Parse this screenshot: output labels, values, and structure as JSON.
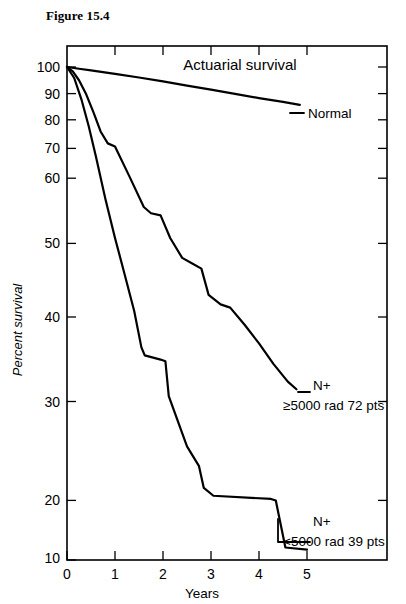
{
  "figure": {
    "caption": "Figure 15.4",
    "plot_title": "Actuarial survival"
  },
  "axes": {
    "y_label": "Percent survival",
    "x_label": "Years",
    "y_ticks": [
      "100",
      "90",
      "80",
      "70",
      "60",
      "50",
      "40",
      "30",
      "20",
      "10"
    ],
    "x_ticks": [
      "0",
      "1",
      "2",
      "3",
      "4",
      "5"
    ]
  },
  "annotations": {
    "normal": "Normal",
    "high_dose_line1": "N+",
    "high_dose_line2": "≥5000 rad   72 pts",
    "low_dose_line1": "N+",
    "low_dose_line2": "<5000 rad   39 pts"
  },
  "chart_data": {
    "type": "line",
    "title": "Actuarial survival",
    "xlabel": "Years",
    "ylabel": "Percent survival",
    "xlim": [
      0,
      5
    ],
    "ylim": [
      10,
      100
    ],
    "yscale": "log",
    "grid": false,
    "legend_position": "inline-annotations",
    "axis_frame": "box",
    "x_ticks": [
      0,
      1,
      2,
      3,
      4,
      5
    ],
    "y_ticks": [
      10,
      20,
      30,
      40,
      50,
      60,
      70,
      80,
      90,
      100
    ],
    "series": [
      {
        "name": "Normal",
        "label": "Normal",
        "n_patients": null,
        "points": [
          [
            0.0,
            100.0
          ],
          [
            0.25,
            99.2
          ],
          [
            0.5,
            98.4
          ],
          [
            0.75,
            97.6
          ],
          [
            1.0,
            96.8
          ],
          [
            1.5,
            95.2
          ],
          [
            2.0,
            93.5
          ],
          [
            2.5,
            91.7
          ],
          [
            3.0,
            90.0
          ],
          [
            3.5,
            88.2
          ],
          [
            4.0,
            86.5
          ],
          [
            4.5,
            85.0
          ],
          [
            4.85,
            83.8
          ]
        ]
      },
      {
        "name": "N+ ≥5000 rad",
        "label": "N+ ≥5000 rad   72 pts",
        "n_patients": 72,
        "points": [
          [
            0.0,
            100.0
          ],
          [
            0.12,
            98.0
          ],
          [
            0.25,
            94.0
          ],
          [
            0.4,
            88.0
          ],
          [
            0.55,
            81.0
          ],
          [
            0.7,
            74.0
          ],
          [
            0.85,
            70.0
          ],
          [
            1.0,
            69.0
          ],
          [
            1.3,
            60.0
          ],
          [
            1.6,
            52.0
          ],
          [
            1.75,
            50.5
          ],
          [
            1.95,
            50.0
          ],
          [
            2.15,
            45.0
          ],
          [
            2.4,
            41.0
          ],
          [
            2.6,
            40.0
          ],
          [
            2.8,
            39.0
          ],
          [
            2.95,
            34.5
          ],
          [
            3.2,
            33.0
          ],
          [
            3.4,
            32.5
          ],
          [
            3.7,
            30.0
          ],
          [
            4.0,
            27.5
          ],
          [
            4.3,
            25.0
          ],
          [
            4.6,
            23.0
          ],
          [
            4.78,
            22.2
          ]
        ]
      },
      {
        "name": "N+ <5000 rad",
        "label": "N+ <5000 rad   39 pts",
        "n_patients": 39,
        "points": [
          [
            0.0,
            100.0
          ],
          [
            0.15,
            95.0
          ],
          [
            0.3,
            86.0
          ],
          [
            0.45,
            76.0
          ],
          [
            0.6,
            66.0
          ],
          [
            0.8,
            54.0
          ],
          [
            1.0,
            45.0
          ],
          [
            1.2,
            38.0
          ],
          [
            1.4,
            32.0
          ],
          [
            1.55,
            27.0
          ],
          [
            1.62,
            26.0
          ],
          [
            1.95,
            25.5
          ],
          [
            2.05,
            25.3
          ],
          [
            2.12,
            21.5
          ],
          [
            2.5,
            17.0
          ],
          [
            2.75,
            15.5
          ],
          [
            2.85,
            14.0
          ],
          [
            3.05,
            13.5
          ],
          [
            4.25,
            13.3
          ],
          [
            4.35,
            13.2
          ],
          [
            4.55,
            10.6
          ],
          [
            5.0,
            10.5
          ]
        ]
      }
    ]
  }
}
